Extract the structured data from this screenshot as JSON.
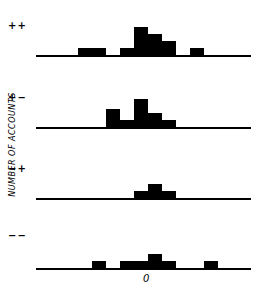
{
  "chart_data": {
    "type": "bar",
    "title": "",
    "xlabel": "",
    "ylabel": "NUMBER OF ACCOUNTS",
    "x_tick_labels": [
      {
        "position_bin": 8,
        "label": "0"
      }
    ],
    "bin_width_px": 14,
    "bins_start_px": 36,
    "grid": false,
    "legend": null,
    "panels": [
      {
        "name": "++",
        "bins": [
          3,
          4,
          6,
          8,
          9,
          10,
          11,
          13
        ],
        "values": [
          1,
          1,
          1,
          4,
          3,
          2,
          1,
          1
        ],
        "bars": [
          {
            "bin": 3,
            "h": 1
          },
          {
            "bin": 4,
            "h": 1
          },
          {
            "bin": 6,
            "h": 1
          },
          {
            "bin": 7,
            "h": 4
          },
          {
            "bin": 8,
            "h": 3
          },
          {
            "bin": 9,
            "h": 2
          },
          {
            "bin": 11,
            "h": 1
          }
        ]
      },
      {
        "name": "+−",
        "bars": [
          {
            "bin": 5,
            "h": 2.5
          },
          {
            "bin": 6,
            "h": 1
          },
          {
            "bin": 7,
            "h": 4
          },
          {
            "bin": 8,
            "h": 2
          },
          {
            "bin": 9,
            "h": 1
          }
        ]
      },
      {
        "name": "−+",
        "bars": [
          {
            "bin": 7,
            "h": 1
          },
          {
            "bin": 8,
            "h": 2
          },
          {
            "bin": 9,
            "h": 1
          }
        ]
      },
      {
        "name": "−−",
        "bars": [
          {
            "bin": 4,
            "h": 1
          },
          {
            "bin": 6,
            "h": 1
          },
          {
            "bin": 7,
            "h": 1
          },
          {
            "bin": 8,
            "h": 2
          },
          {
            "bin": 9,
            "h": 1
          },
          {
            "bin": 12,
            "h": 1
          }
        ]
      }
    ]
  },
  "labels": {
    "panel1": "++",
    "panel2": "+−",
    "panel3": "−+",
    "panel4": "−−",
    "ylabel": "NUMBER OF ACCOUNTS",
    "xtick": "0"
  },
  "layout": {
    "baselines": [
      55,
      127,
      198,
      268
    ],
    "unit_px": 7
  }
}
